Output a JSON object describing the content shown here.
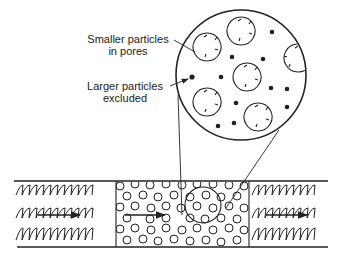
{
  "diagram": {
    "type": "size-exclusion-chromatography-schematic",
    "labels": {
      "small": {
        "line1": "Smaller particles",
        "line2": "in pores"
      },
      "large": {
        "line1": "Larger particles",
        "line2": "excluded"
      }
    },
    "magnified_view": {
      "shape": "circle",
      "contents": [
        "porous beads",
        "small particles (dots)"
      ]
    },
    "column": {
      "sections": [
        "packing-free inlet (wavy flow)",
        "porous bead packing",
        "packing-free outlet (wavy flow)"
      ],
      "flow_direction": "left-to-right"
    },
    "colors": {
      "ink": "#222222",
      "background": "#ffffff"
    }
  }
}
